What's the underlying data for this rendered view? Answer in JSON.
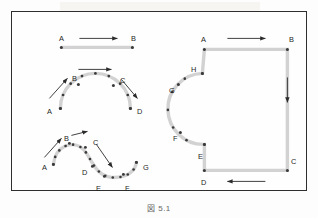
{
  "figure": {
    "caption": "図 5.1",
    "frame_border_color": "#2e2e2e",
    "path_color": "#d2d2d2",
    "dot_color": "#3a3a3a",
    "arrow_color": "#2b2b2b",
    "label_color": "#1f1f1f",
    "background_color": "#fefefe"
  },
  "shapes": {
    "straight_line": {
      "name": "straight-line-segment",
      "labels": [
        {
          "text": "A",
          "x": 58,
          "y": 34
        },
        {
          "text": "B",
          "x": 130,
          "y": 34
        }
      ],
      "endpoints": [
        {
          "label": "A",
          "x": 62,
          "y": 48
        },
        {
          "label": "B",
          "x": 133,
          "y": 48
        }
      ],
      "direction_arrow": {
        "from_x": 80,
        "to_x": 118,
        "y": 39,
        "direction": "right"
      }
    },
    "semicircle_arc": {
      "name": "semicircular-arc",
      "labels": [
        {
          "text": "A",
          "x": 46,
          "y": 107
        },
        {
          "text": "B",
          "x": 71,
          "y": 74
        },
        {
          "text": "C",
          "x": 119,
          "y": 76
        },
        {
          "text": "D",
          "x": 136,
          "y": 107
        }
      ],
      "endpoints": [
        {
          "label": "A",
          "x": 61,
          "y": 109
        },
        {
          "label": "B",
          "x": 79,
          "y": 85
        },
        {
          "label": "C",
          "x": 114,
          "y": 86
        },
        {
          "label": "D",
          "x": 131,
          "y": 109
        }
      ],
      "direction_arrows": [
        {
          "from_x": 50,
          "from_y": 99,
          "to_x": 68,
          "to_y": 79,
          "direction": "up-right"
        },
        {
          "from_x": 79,
          "from_y": 70,
          "to_x": 112,
          "to_y": 70,
          "direction": "right"
        },
        {
          "from_x": 122,
          "from_y": 80,
          "to_x": 138,
          "to_y": 99,
          "direction": "down-right"
        }
      ],
      "marker_count": 9
    },
    "s_curve": {
      "name": "s-curve-path",
      "labels": [
        {
          "text": "A",
          "x": 41,
          "y": 163
        },
        {
          "text": "B",
          "x": 63,
          "y": 134
        },
        {
          "text": "C",
          "x": 92,
          "y": 138
        },
        {
          "text": "D",
          "x": 81,
          "y": 168
        },
        {
          "text": "E",
          "x": 95,
          "y": 184
        },
        {
          "text": "F",
          "x": 124,
          "y": 184
        },
        {
          "text": "G",
          "x": 142,
          "y": 163
        }
      ],
      "endpoints": [
        {
          "label": "A",
          "x": 54,
          "y": 165
        },
        {
          "label": "B",
          "x": 70,
          "y": 144
        },
        {
          "label": "C",
          "x": 86,
          "y": 148
        },
        {
          "label": "D",
          "x": 93,
          "y": 167
        },
        {
          "label": "E",
          "x": 105,
          "y": 177
        },
        {
          "label": "F",
          "x": 124,
          "y": 175
        },
        {
          "label": "G",
          "x": 137,
          "y": 163
        }
      ],
      "direction_arrows": [
        {
          "from_x": 45,
          "from_y": 158,
          "to_x": 62,
          "to_y": 139,
          "direction": "up-right"
        },
        {
          "from_x": 72,
          "from_y": 136,
          "to_x": 88,
          "to_y": 132,
          "direction": "right"
        },
        {
          "from_x": 97,
          "from_y": 145,
          "to_x": 113,
          "to_y": 168,
          "direction": "down-right"
        }
      ],
      "marker_count": 16
    },
    "closed_path": {
      "name": "closed-path-with-concave-arc",
      "labels": [
        {
          "text": "A",
          "x": 200,
          "y": 35
        },
        {
          "text": "B",
          "x": 288,
          "y": 35
        },
        {
          "text": "C",
          "x": 290,
          "y": 157
        },
        {
          "text": "D",
          "x": 200,
          "y": 178
        },
        {
          "text": "E",
          "x": 197,
          "y": 152
        },
        {
          "text": "F",
          "x": 172,
          "y": 134
        },
        {
          "text": "G",
          "x": 168,
          "y": 86
        },
        {
          "text": "H",
          "x": 190,
          "y": 65
        }
      ],
      "vertices": [
        {
          "label": "A",
          "x": 205,
          "y": 50
        },
        {
          "label": "B",
          "x": 288,
          "y": 50
        },
        {
          "label": "C",
          "x": 288,
          "y": 171
        },
        {
          "label": "D",
          "x": 205,
          "y": 171
        },
        {
          "label": "E",
          "x": 205,
          "y": 145
        },
        {
          "label": "F",
          "x": 181,
          "y": 133
        },
        {
          "label": "G",
          "x": 179,
          "y": 85
        },
        {
          "label": "H",
          "x": 203,
          "y": 74
        }
      ],
      "direction_arrows": [
        {
          "from_x": 228,
          "from_y": 39,
          "to_x": 266,
          "to_y": 39,
          "direction": "right"
        },
        {
          "from_x": 288,
          "from_y": 78,
          "to_x": 288,
          "to_y": 103,
          "direction": "down"
        },
        {
          "from_x": 266,
          "from_y": 182,
          "to_x": 228,
          "to_y": 182,
          "direction": "left"
        }
      ],
      "arc_marker_count": 7
    }
  }
}
